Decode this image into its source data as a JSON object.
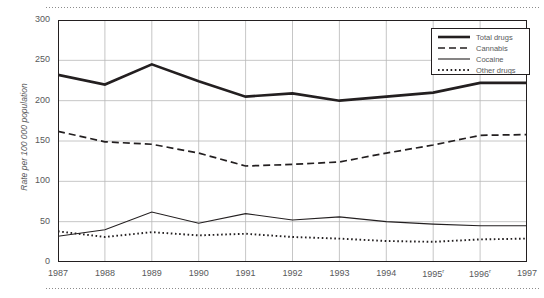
{
  "chart_data": {
    "type": "line",
    "title": "",
    "xlabel": "",
    "ylabel": "Rate per 100 000 population",
    "categories": [
      "1987",
      "1988",
      "1989",
      "1990",
      "1991",
      "1992",
      "1993",
      "1994",
      "1995",
      "1996",
      "1997"
    ],
    "tick_labels": [
      "1987",
      "1988",
      "1989",
      "1990",
      "1991",
      "1992",
      "1993",
      "1994",
      "1995r",
      "1996r",
      "1997"
    ],
    "tick_superscripts": [
      "",
      "",
      "",
      "",
      "",
      "",
      "",
      "",
      "r",
      "r",
      ""
    ],
    "ylim": [
      0,
      300
    ],
    "yticks": [
      0,
      50,
      100,
      150,
      200,
      250,
      300
    ],
    "ytick_labels": [
      "0",
      "50",
      "100",
      "150",
      "200",
      "250",
      "300"
    ],
    "grid": true,
    "legend_position": "top-right",
    "series": [
      {
        "name": "Total drugs",
        "style": "solid-thick",
        "color": "#231f20",
        "values": [
          232,
          220,
          245,
          224,
          205,
          209,
          200,
          205,
          210,
          222,
          222
        ]
      },
      {
        "name": "Cannabis",
        "style": "dashed",
        "color": "#231f20",
        "values": [
          162,
          149,
          146,
          135,
          119,
          121,
          124,
          135,
          145,
          157,
          158
        ]
      },
      {
        "name": "Cocaine",
        "style": "solid-thin",
        "color": "#231f20",
        "values": [
          32,
          40,
          62,
          48,
          60,
          52,
          56,
          50,
          47,
          45,
          45
        ]
      },
      {
        "name": "Other drugs",
        "style": "dotted",
        "color": "#231f20",
        "values": [
          38,
          31,
          37,
          33,
          35,
          31,
          29,
          26,
          25,
          28,
          29
        ]
      }
    ]
  },
  "legend": {
    "items": [
      {
        "label": "Total drugs"
      },
      {
        "label": "Cannabis"
      },
      {
        "label": "Cocaine"
      },
      {
        "label": "Other drugs"
      }
    ]
  }
}
